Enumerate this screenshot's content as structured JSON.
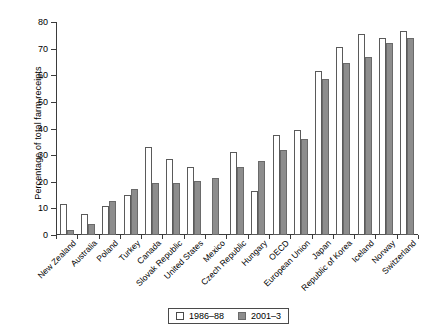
{
  "chart_data": {
    "type": "bar",
    "title": "",
    "xlabel": "",
    "ylabel": "Percentage of total farm receipts",
    "ylim": [
      0,
      80
    ],
    "yticks": [
      0,
      10,
      20,
      30,
      40,
      50,
      60,
      70,
      80
    ],
    "grid": false,
    "legend_position": "bottom",
    "categories": [
      "New Zealand",
      "Australia",
      "Poland",
      "Turkey",
      "Canada",
      "Slovak Republic",
      "United States",
      "Mexico",
      "Czech Republic",
      "Hungary",
      "OECD",
      "European Union",
      "Japan",
      "Republic of Korea",
      "Iceland",
      "Norway",
      "Switzerland"
    ],
    "series": [
      {
        "name": "1986–88",
        "color": "#ffffff",
        "values": [
          11.5,
          7.8,
          11.0,
          15.0,
          33.0,
          28.5,
          25.5,
          0.0,
          31.0,
          16.7,
          37.5,
          39.3,
          61.5,
          70.5,
          75.5,
          74.0,
          76.5
        ]
      },
      {
        "name": "2001–3",
        "color": "#8d8d8d",
        "values": [
          1.7,
          4.0,
          12.7,
          17.3,
          19.5,
          19.7,
          20.3,
          21.5,
          25.5,
          27.7,
          31.8,
          36.0,
          58.5,
          64.5,
          67.0,
          72.0,
          74.0
        ]
      }
    ]
  },
  "legend": {
    "items": [
      {
        "label": "1986–88",
        "swatch": "open-square-icon"
      },
      {
        "label": "2001–3",
        "swatch": "filled-square-icon"
      }
    ]
  }
}
